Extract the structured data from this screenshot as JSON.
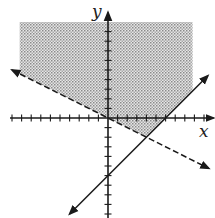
{
  "chart_data": {
    "type": "line",
    "title": "",
    "xlabel": "x",
    "ylabel": "y",
    "xlim": [
      -10,
      11
    ],
    "ylim": [
      -10.5,
      11
    ],
    "x_ticks": [
      -10,
      -9,
      -8,
      -7,
      -6,
      -5,
      -4,
      -3,
      -2,
      -1,
      1,
      2,
      3,
      4,
      5,
      6,
      7,
      8,
      9,
      10
    ],
    "y_ticks": [
      -10,
      -9,
      -8,
      -7,
      -6,
      -5,
      -4,
      -3,
      -2,
      -1,
      1,
      2,
      3,
      4,
      5,
      6,
      7,
      8,
      9
    ],
    "tick_labels_shown": false,
    "grid": false,
    "series": [
      {
        "name": "boundary-dashed",
        "equation": "y = -x/2",
        "slope": -0.5,
        "intercept": 0,
        "style": "dashed",
        "x_range": [
          -10,
          10.5
        ],
        "arrows": "both"
      },
      {
        "name": "boundary-solid",
        "equation": "y = x - 6",
        "slope": 1,
        "intercept": -6,
        "style": "solid",
        "x_range": [
          -4,
          10.4
        ],
        "arrows": "both"
      }
    ],
    "shaded_region": {
      "description": "y > -x/2 and y >= x - 6",
      "x_range": [
        -9.2,
        8.8
      ],
      "y_top": 10,
      "vertex": [
        4,
        -2
      ]
    },
    "colors": {
      "axis": "#1a1a1a",
      "line": "#1a1a1a",
      "shade": "#9a9a9a"
    }
  }
}
